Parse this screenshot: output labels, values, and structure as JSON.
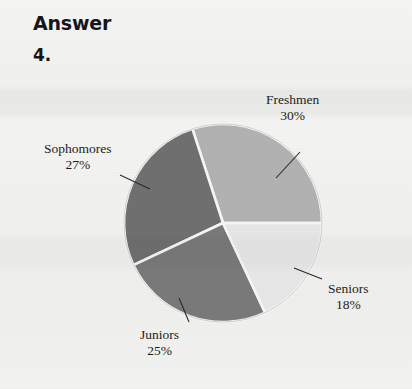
{
  "heading": {
    "answer_label": "Answer",
    "question_number": "4."
  },
  "chart_data": {
    "type": "pie",
    "title": "",
    "subtitle": "",
    "xlabel": "",
    "ylabel": "",
    "grid": false,
    "legend_position": "callout-labels",
    "categories": [
      "Freshmen",
      "Sophomores",
      "Juniors",
      "Seniors"
    ],
    "values": [
      30,
      27,
      25,
      18
    ],
    "value_unit": "%",
    "labels": [
      {
        "name": "Freshmen",
        "percent_text": "30%",
        "value": 30,
        "color": "#b1b1b1"
      },
      {
        "name": "Sophomores",
        "percent_text": "27%",
        "value": 27,
        "color": "#6f6f6f"
      },
      {
        "name": "Juniors",
        "percent_text": "25%",
        "value": 25,
        "color": "#797979"
      },
      {
        "name": "Seniors",
        "percent_text": "18%",
        "value": 18,
        "color": "#e6e6e6"
      }
    ],
    "slice_separator_color": "#f5f5f3",
    "outline_color": "#9a9a9a"
  },
  "colors": {
    "page_background": "#f1f1ef",
    "text": "#1d1d20",
    "heading_text": "#16161a",
    "freshmen": "#b1b1b1",
    "sophomores": "#6f6f6f",
    "juniors": "#797979",
    "seniors": "#e6e6e6"
  }
}
